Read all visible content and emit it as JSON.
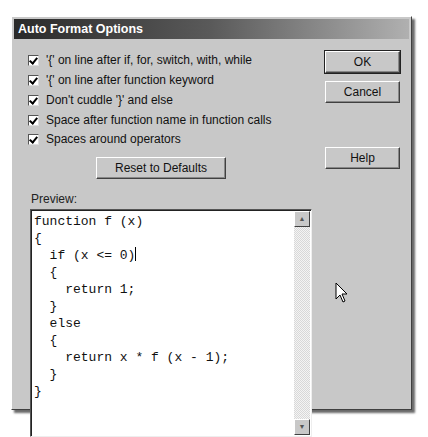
{
  "dialog": {
    "title": "Auto Format Options",
    "options": [
      {
        "label": "'{' on line after if, for, switch, with, while",
        "checked": true
      },
      {
        "label": "'{' on line after function keyword",
        "checked": true
      },
      {
        "label": "Don't cuddle '}' and else",
        "checked": true
      },
      {
        "label": "Space after function name in function calls",
        "checked": true
      },
      {
        "label": "Spaces around operators",
        "checked": true
      }
    ],
    "buttons": {
      "ok": "OK",
      "cancel": "Cancel",
      "help": "Help",
      "reset": "Reset to Defaults"
    },
    "preview": {
      "label": "Preview:",
      "lines": [
        "function f (x)",
        "{",
        "  if (x <= 0)",
        "  {",
        "    return 1;",
        "  }",
        "  else",
        "  {",
        "    return x * f (x - 1);",
        "  }",
        "}"
      ]
    },
    "scrollbar": {
      "up_icon": "▲",
      "down_icon": "▼"
    }
  }
}
